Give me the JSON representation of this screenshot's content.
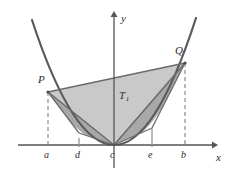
{
  "figure": {
    "background_color": "#ffffff",
    "width": 229,
    "height": 175
  },
  "axes": {
    "x_label": "x",
    "y_label": "y",
    "axis_color": "#555555",
    "origin_px": [
      114,
      145
    ],
    "x_axis_y_px": 145,
    "y_axis_x_px": 114,
    "x_axis_start_px": 18,
    "x_axis_end_px": 216,
    "y_axis_top_px": 13,
    "y_axis_bottom_px": 168
  },
  "curve": {
    "name": "parabola",
    "color": "#5a5a5a",
    "stroke_width": 2,
    "vertex_px": [
      114,
      145
    ],
    "left_end_px": [
      32,
      20
    ],
    "right_end_px": [
      196,
      18
    ]
  },
  "points": [
    {
      "id": "P",
      "label": "P",
      "x_px": 48,
      "y_px": 92,
      "label_x_px": 38,
      "label_y_px": 74
    },
    {
      "id": "Q",
      "label": "Q",
      "x_px": 185,
      "y_px": 63,
      "label_x_px": 175,
      "label_y_px": 45
    },
    {
      "id": "c",
      "label": "c",
      "x_px": 114,
      "y_px": 145
    }
  ],
  "ticks": [
    {
      "label": "a",
      "x_px": 48,
      "label_x_px": 44,
      "label_y_px": 150,
      "dashed": true,
      "dash_top_px": 92
    },
    {
      "label": "d",
      "x_px": 79,
      "label_x_px": 75,
      "label_y_px": 150,
      "dashed": false,
      "tick_top_px": 138
    },
    {
      "label": "c",
      "x_px": 114,
      "label_x_px": 110,
      "label_y_px": 150,
      "dashed": false,
      "tick_top_px": 145
    },
    {
      "label": "e",
      "x_px": 152,
      "label_x_px": 148,
      "label_y_px": 150,
      "dashed": false,
      "tick_top_px": 138
    },
    {
      "label": "b",
      "x_px": 185,
      "label_x_px": 181,
      "label_y_px": 150,
      "dashed": true,
      "dash_top_px": 63
    }
  ],
  "regions": [
    {
      "id": "T1",
      "label": "T",
      "subscript": "1",
      "vertices": "P,Q,c",
      "fill": "#c9c9c9",
      "label_x_px": 119,
      "label_y_px": 90
    },
    {
      "id": "T_left",
      "label": "",
      "subscript": "",
      "vertices": "P,d,c",
      "fill": "#a8a8a8"
    },
    {
      "id": "T_right",
      "label": "",
      "subscript": "",
      "vertices": "c,e,Q",
      "fill": "#a8a8a8"
    }
  ],
  "colors": {
    "curve": "#5a5a5a",
    "axis": "#555555",
    "triangle_outer": "#c9c9c9",
    "triangle_inner": "#a8a8a8",
    "chord": "#6b6b6b",
    "dashed": "#8c8c8c",
    "text": "#2b2b2b"
  }
}
